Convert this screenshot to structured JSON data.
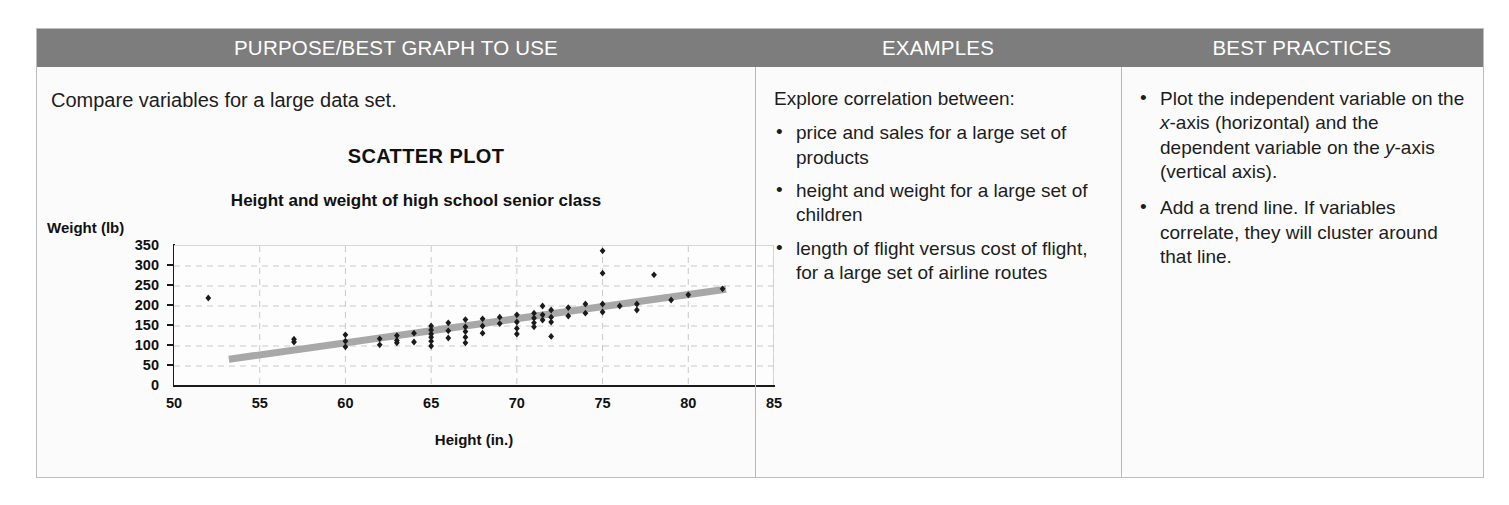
{
  "table": {
    "headers": {
      "purpose": "PURPOSE/BEST GRAPH TO USE",
      "examples": "EXAMPLES",
      "best_practices": "BEST PRACTICES"
    },
    "header_bg": "#7d7d7d",
    "header_text_color": "#ffffff",
    "border_color": "#bdbdbd"
  },
  "purpose": {
    "lead": "Compare variables for a large data set.",
    "chart_type_label": "SCATTER PLOT"
  },
  "examples": {
    "intro": "Explore correlation between:",
    "bullets": [
      "price and sales for a large set of products",
      "height and weight for a large set of children",
      "length of flight versus cost of flight, for a large set of airline routes"
    ]
  },
  "best_practices": {
    "bullets": [
      {
        "parts": [
          {
            "text": "Plot the independent variable on the ",
            "italic": false
          },
          {
            "text": "x",
            "italic": true
          },
          {
            "text": "-axis (horizontal) and the dependent variable on the ",
            "italic": false
          },
          {
            "text": "y",
            "italic": true
          },
          {
            "text": "-axis (vertical axis).",
            "italic": false
          }
        ]
      },
      {
        "parts": [
          {
            "text": "Add a trend line. If variables correlate, they will cluster around that line.",
            "italic": false
          }
        ]
      }
    ]
  },
  "chart_data": {
    "type": "scatter",
    "title": "Height and weight of high school senior class",
    "xlabel": "Height (in.)",
    "ylabel": "Weight (lb)",
    "xlim": [
      50,
      85
    ],
    "ylim": [
      0,
      350
    ],
    "xticks": [
      50,
      55,
      60,
      65,
      70,
      75,
      80,
      85
    ],
    "yticks": [
      0,
      50,
      100,
      150,
      200,
      250,
      300,
      350
    ],
    "grid": true,
    "grid_style": "dashed",
    "legend": "none",
    "point_color": "#1a1a1a",
    "trendline": {
      "show": true,
      "color": "#a8a8a8",
      "width": 7,
      "x_start": 53.2,
      "y_start": 67,
      "x_end": 82.2,
      "y_end": 242
    },
    "points": [
      [
        52.0,
        220
      ],
      [
        57.0,
        117
      ],
      [
        57.0,
        110
      ],
      [
        60.0,
        128
      ],
      [
        60.0,
        112
      ],
      [
        60.0,
        98
      ],
      [
        62.0,
        118
      ],
      [
        62.0,
        103
      ],
      [
        63.0,
        126
      ],
      [
        63.0,
        114
      ],
      [
        63.0,
        108
      ],
      [
        64.0,
        132
      ],
      [
        64.0,
        110
      ],
      [
        65.0,
        150
      ],
      [
        65.0,
        140
      ],
      [
        65.0,
        130
      ],
      [
        65.0,
        122
      ],
      [
        65.0,
        112
      ],
      [
        65.0,
        100
      ],
      [
        66.0,
        158
      ],
      [
        66.0,
        138
      ],
      [
        66.0,
        120
      ],
      [
        67.0,
        166
      ],
      [
        67.0,
        148
      ],
      [
        67.0,
        136
      ],
      [
        67.0,
        122
      ],
      [
        67.0,
        108
      ],
      [
        68.0,
        168
      ],
      [
        68.0,
        150
      ],
      [
        68.0,
        132
      ],
      [
        69.0,
        172
      ],
      [
        69.0,
        156
      ],
      [
        70.0,
        178
      ],
      [
        70.0,
        160
      ],
      [
        70.0,
        144
      ],
      [
        70.0,
        130
      ],
      [
        71.0,
        182
      ],
      [
        71.0,
        170
      ],
      [
        71.0,
        158
      ],
      [
        71.0,
        148
      ],
      [
        71.5,
        200
      ],
      [
        71.5,
        178
      ],
      [
        71.5,
        165
      ],
      [
        72.0,
        190
      ],
      [
        72.0,
        172
      ],
      [
        72.0,
        160
      ],
      [
        72.0,
        124
      ],
      [
        73.0,
        196
      ],
      [
        73.0,
        175
      ],
      [
        74.0,
        205
      ],
      [
        74.0,
        182
      ],
      [
        75.0,
        338
      ],
      [
        75.0,
        282
      ],
      [
        75.0,
        205
      ],
      [
        75.0,
        185
      ],
      [
        76.0,
        200
      ],
      [
        77.0,
        205
      ],
      [
        77.0,
        190
      ],
      [
        78.0,
        278
      ],
      [
        79.0,
        215
      ],
      [
        80.0,
        228
      ],
      [
        82.0,
        243
      ]
    ]
  }
}
